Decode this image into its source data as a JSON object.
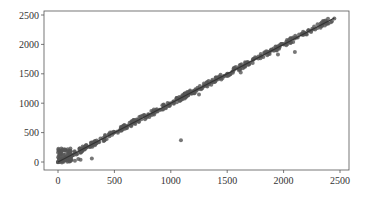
{
  "chart_data": {
    "type": "scatter",
    "title": "",
    "xlabel": "",
    "ylabel": "",
    "xlim": [
      -100,
      2560
    ],
    "ylim": [
      -50,
      2560
    ],
    "x_ticks": [
      0,
      500,
      1000,
      1500,
      2000,
      2500
    ],
    "y_ticks": [
      0,
      500,
      1000,
      1500,
      2000,
      2500
    ],
    "x_tick_labels": [
      "0",
      "500",
      "1000",
      "1500",
      "2000",
      "2500"
    ],
    "y_tick_labels": [
      "0",
      "500",
      "1000",
      "1500",
      "2000",
      "2500"
    ],
    "grid": false,
    "legend": null,
    "series": [
      {
        "name": "points",
        "color": "#555555",
        "description": "Dense cluster along y = x from 0 to ~2450, plus a cluster near origin (x 0-300, y 0-250) and an outlier near (1090, 370)",
        "points": [
          [
            0,
            0
          ],
          [
            10,
            200
          ],
          [
            20,
            150
          ],
          [
            30,
            230
          ],
          [
            40,
            100
          ],
          [
            50,
            60
          ],
          [
            60,
            200
          ],
          [
            80,
            30
          ],
          [
            100,
            120
          ],
          [
            120,
            40
          ],
          [
            150,
            20
          ],
          [
            180,
            50
          ],
          [
            200,
            40
          ],
          [
            300,
            60
          ],
          [
            100,
            100
          ],
          [
            200,
            210
          ],
          [
            300,
            290
          ],
          [
            400,
            410
          ],
          [
            500,
            500
          ],
          [
            600,
            590
          ],
          [
            650,
            680
          ],
          [
            700,
            700
          ],
          [
            800,
            810
          ],
          [
            900,
            890
          ],
          [
            1000,
            1000
          ],
          [
            1050,
            1080
          ],
          [
            1090,
            370
          ],
          [
            1100,
            1100
          ],
          [
            1200,
            1200
          ],
          [
            1250,
            1150
          ],
          [
            1300,
            1310
          ],
          [
            1400,
            1390
          ],
          [
            1500,
            1500
          ],
          [
            1600,
            1600
          ],
          [
            1620,
            1520
          ],
          [
            1700,
            1690
          ],
          [
            1800,
            1800
          ],
          [
            1900,
            1900
          ],
          [
            1950,
            1830
          ],
          [
            2000,
            2000
          ],
          [
            2100,
            1870
          ],
          [
            2200,
            2180
          ],
          [
            2300,
            2280
          ],
          [
            2350,
            2400
          ],
          [
            2450,
            2440
          ]
        ]
      },
      {
        "name": "fit-line",
        "color": "#333333",
        "type": "line",
        "points": [
          [
            0,
            0
          ],
          [
            2450,
            2450
          ]
        ]
      }
    ]
  }
}
